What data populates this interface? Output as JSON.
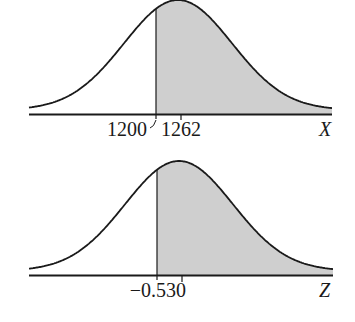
{
  "chart_data": [
    {
      "type": "area",
      "title": "",
      "description": "Normal distribution curve of X with area to the right of 1200 shaded",
      "xlabel": "X",
      "ylabel": "",
      "mean": 1262,
      "shade_from": 1200,
      "shade_direction": "right",
      "tick_labels": [
        "1200",
        "1262"
      ],
      "grid": false,
      "legend": null
    },
    {
      "type": "area",
      "title": "",
      "description": "Standard normal curve of Z with area to the right of -0.53 shaded",
      "xlabel": "Z",
      "ylabel": "",
      "mean": 0,
      "shade_from": -0.53,
      "shade_direction": "right",
      "tick_labels": [
        "-0.53",
        "0"
      ],
      "grid": false,
      "legend": null
    }
  ],
  "top": {
    "cut_label": "1200",
    "mean_label": "1262",
    "axis_label": "X"
  },
  "bottom": {
    "cut_label": "−0.53",
    "mean_label": "0",
    "axis_label": "Z"
  },
  "colors": {
    "shade": "#cfcfcf",
    "line": "#1a1a1a"
  }
}
